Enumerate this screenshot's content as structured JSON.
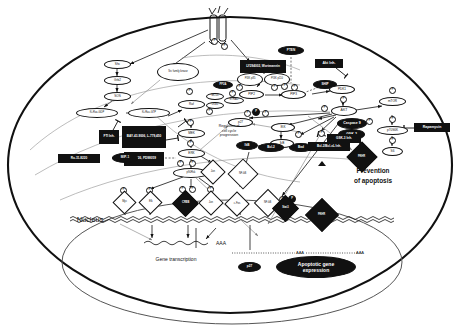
{
  "figure": {
    "cell_label": "",
    "nucleus_label": "Nucleus",
    "gene_transcription_label": "Gene transcription",
    "poly_a_label": "AAA",
    "poly_a_label_2": "AAA",
    "prevention_line1": "Prevention",
    "prevention_line2": "of  apoptosis",
    "cellcycle_line1": "Regulation of",
    "cellcycle_line2": "cell  cycle",
    "cellcycle_line3": "progression",
    "apoptotic_line1": "Apoptotic  gene",
    "apoptotic_line2": "expression"
  },
  "membrane": {
    "receptor_label": "R",
    "ligand_label": ""
  },
  "nodes": {
    "shc": "Shc",
    "grb2": "Grb2",
    "sos": "SOS",
    "ras_gdp": "Ki-Ras-GDP",
    "ras_gtp": "Ki-Ras-GTP",
    "raf": "Raf",
    "mek": "MEK",
    "erk": "ERK",
    "p90rsk": "p90Rsk",
    "src": "Src family kinase",
    "pi3k_p85": "PI3K p85",
    "pi3k_p110": "PI3K p110",
    "pip2": "PIP2",
    "pip3": "PIP3",
    "pten": "PTEN",
    "ship": "SHIP",
    "pdk1": "PDK1",
    "akt": "AKT",
    "mtor": "mTOR",
    "p70s6k": "p70S6K",
    "s6": "S6",
    "gsk3": "GSK-3",
    "caspase9": "Caspase 9",
    "bad": "Bad",
    "bcl2": "Bcl-2",
    "ikk": "IKK",
    "ikb": "IkB",
    "ikb2": "IkB",
    "p27": "p27",
    "nfkb_dia": "NF-kB",
    "fkhr_dia": "FKHR",
    "jun_dia": "Jun",
    "pp2a": "PP2A",
    "mo25": "MO25",
    "lkb1": "LKB1",
    "strad": "STRAD"
  },
  "phospho": {
    "p": "P"
  },
  "inhibitors": {
    "fti": "FTI Inh.",
    "raf_inh": "BAY-43-9006, L-779,450",
    "mek_inh": "U0126, PD98059",
    "ro318220": "Ro-31-8220",
    "mip1": "MIP-1",
    "pi3k_inh": "LY294002, Wortmannin",
    "akt_inh": "Akt Inh.",
    "gsk3_inh": "GSK-3 Inh.",
    "bcl2_inh": "Bcl-2/Bcl-xL Inh.",
    "rapamycin": "Rapamycin"
  },
  "tfactors": [
    {
      "label": "Myc",
      "p": 1
    },
    {
      "label": "Elk",
      "p": 1
    },
    {
      "label": "CREB",
      "p": 2
    },
    {
      "label": "Jun",
      "p": 1
    },
    {
      "label": "c-Fos",
      "p": 0
    },
    {
      "label": "NF-kB",
      "p": 0
    },
    {
      "label": "Stat3",
      "p": 1
    },
    {
      "label": "FKHR",
      "p": 0
    }
  ],
  "nucleus_small": {
    "p21": "p27"
  },
  "colors": {
    "ink": "#111111",
    "paper": "#ffffff",
    "grey": "#8a8a8a"
  }
}
